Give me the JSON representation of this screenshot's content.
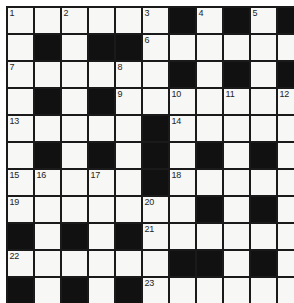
{
  "puzzle": {
    "kind": "crossword-grid",
    "rows": 11,
    "cols": 11,
    "colors": {
      "block": "#111111",
      "cell": "#f7f7f5",
      "border": "#1a1a1a",
      "number": "#242424",
      "page_background": "#ffffff"
    },
    "legend": {
      "1": "white cell",
      "0": "black block"
    },
    "cells": [
      [
        1,
        1,
        1,
        1,
        1,
        1,
        0,
        1,
        0,
        1,
        0
      ],
      [
        1,
        0,
        1,
        0,
        0,
        1,
        1,
        1,
        1,
        1,
        1
      ],
      [
        1,
        1,
        1,
        1,
        1,
        1,
        0,
        1,
        0,
        1,
        0
      ],
      [
        1,
        0,
        1,
        0,
        1,
        1,
        1,
        1,
        1,
        1,
        1
      ],
      [
        1,
        1,
        1,
        1,
        1,
        0,
        1,
        1,
        1,
        1,
        1
      ],
      [
        1,
        0,
        1,
        0,
        1,
        0,
        1,
        0,
        1,
        0,
        1
      ],
      [
        1,
        1,
        1,
        1,
        1,
        0,
        1,
        1,
        1,
        1,
        1
      ],
      [
        1,
        1,
        1,
        1,
        1,
        1,
        1,
        0,
        1,
        0,
        1
      ],
      [
        0,
        1,
        0,
        1,
        0,
        1,
        1,
        1,
        1,
        1,
        1
      ],
      [
        1,
        1,
        1,
        1,
        1,
        1,
        0,
        0,
        1,
        0,
        1
      ],
      [
        0,
        1,
        0,
        1,
        0,
        1,
        1,
        1,
        1,
        1,
        1
      ]
    ],
    "numbers": [
      {
        "row": 1,
        "col": 1,
        "label": "1"
      },
      {
        "row": 1,
        "col": 3,
        "label": "2"
      },
      {
        "row": 1,
        "col": 6,
        "label": "3"
      },
      {
        "row": 1,
        "col": 8,
        "label": "4"
      },
      {
        "row": 1,
        "col": 10,
        "label": "5"
      },
      {
        "row": 2,
        "col": 6,
        "label": "6"
      },
      {
        "row": 3,
        "col": 1,
        "label": "7"
      },
      {
        "row": 3,
        "col": 5,
        "label": "8"
      },
      {
        "row": 4,
        "col": 5,
        "label": "9"
      },
      {
        "row": 4,
        "col": 7,
        "label": "10"
      },
      {
        "row": 4,
        "col": 9,
        "label": "11"
      },
      {
        "row": 4,
        "col": 11,
        "label": "12"
      },
      {
        "row": 5,
        "col": 1,
        "label": "13"
      },
      {
        "row": 5,
        "col": 7,
        "label": "14"
      },
      {
        "row": 7,
        "col": 1,
        "label": "15"
      },
      {
        "row": 7,
        "col": 2,
        "label": "16"
      },
      {
        "row": 7,
        "col": 4,
        "label": "17"
      },
      {
        "row": 7,
        "col": 7,
        "label": "18"
      },
      {
        "row": 8,
        "col": 1,
        "label": "19"
      },
      {
        "row": 8,
        "col": 6,
        "label": "20"
      },
      {
        "row": 9,
        "col": 6,
        "label": "21"
      },
      {
        "row": 10,
        "col": 1,
        "label": "22"
      },
      {
        "row": 11,
        "col": 6,
        "label": "23"
      }
    ]
  }
}
